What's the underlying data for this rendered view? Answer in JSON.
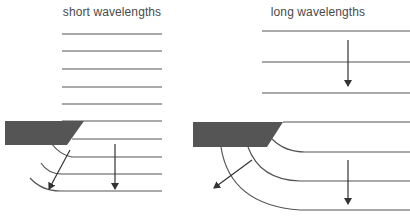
{
  "panels": [
    {
      "id": "short",
      "title": "short wavelengths",
      "title_pos": [
        112,
        5
      ],
      "wavefronts_incoming": {
        "x1": 62,
        "x2": 162,
        "ys": [
          34,
          51,
          69,
          87,
          104,
          121
        ]
      },
      "barrier": {
        "points": "5,121 84,121 67,145 5,145",
        "color": "#555555"
      },
      "wavefronts_after": [
        {
          "path": "M 72 139 L 162 139"
        },
        {
          "path": "M 51 143 Q 60 155 72 157 L 162 157"
        },
        {
          "path": "M 41 163 Q 48 174 62 174 L 162 174"
        },
        {
          "path": "M 30 178 Q 42 191 60 191 L 162 191"
        }
      ],
      "arrows": [
        {
          "x1": 70,
          "y1": 150,
          "x2": 49,
          "y2": 189,
          "kind": "diffracted"
        },
        {
          "x1": 115,
          "y1": 144,
          "x2": 115,
          "y2": 189,
          "kind": "straight"
        }
      ]
    },
    {
      "id": "long",
      "title": "long wavelengths",
      "title_pos": [
        318,
        5
      ],
      "wavefronts_incoming": {
        "x1": 262,
        "x2": 410,
        "ys": [
          31,
          62,
          93
        ]
      },
      "incoming_arrow": {
        "x1": 348,
        "y1": 40,
        "x2": 348,
        "y2": 86
      },
      "barrier": {
        "points": "193,122 283,122 267,147 193,147",
        "color": "#555555"
      },
      "wavefronts_after": [
        {
          "path": "M 283 122 L 410 122"
        },
        {
          "path": "M 272 139 Q 285 152 305 152 L 410 152"
        },
        {
          "path": "M 248 147 Q 260 180 300 181 L 410 181"
        },
        {
          "path": "M 221 147 Q 230 205 300 210 L 410 210"
        }
      ],
      "arrows": [
        {
          "x1": 252,
          "y1": 160,
          "x2": 214,
          "y2": 188,
          "kind": "diffracted"
        },
        {
          "x1": 348,
          "y1": 160,
          "x2": 348,
          "y2": 204,
          "kind": "straight"
        }
      ]
    }
  ],
  "colors": {
    "line": "#555555",
    "barrier": "#555555",
    "text": "#4a4a4a"
  }
}
